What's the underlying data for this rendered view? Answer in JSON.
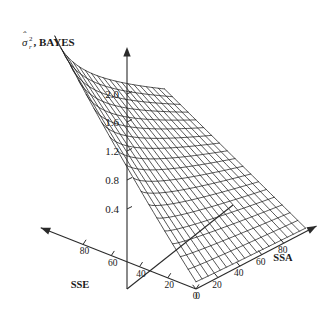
{
  "figure": {
    "type": "3d-surface-mesh",
    "background_color": "#ffffff",
    "line_color": "#1c1c1c",
    "axis_color": "#2a2a2a"
  },
  "zaxis": {
    "label_symbol": "σ",
    "label_hat": "ˆ",
    "label_superscript": "2",
    "label_subscript": "r",
    "label_text": ", BAYES",
    "full_label": "σ̂²r, BAYES",
    "ticks": [
      "2.0",
      "1.6",
      "1.2",
      "0.8",
      "0.4"
    ],
    "tick_values": [
      2.0,
      1.6,
      1.2,
      0.8,
      0.4
    ],
    "range": [
      0.0,
      2.4
    ],
    "arrow": "up"
  },
  "xaxis": {
    "label": "SSE",
    "ticks": [
      "80",
      "60",
      "40",
      "20",
      "0"
    ],
    "tick_values": [
      80,
      60,
      40,
      20,
      0
    ],
    "range": [
      0,
      100
    ],
    "direction": "decreasing-right",
    "arrow": "left"
  },
  "yaxis": {
    "label": "SSA",
    "ticks": [
      "0",
      "20",
      "40",
      "60",
      "80"
    ],
    "tick_values": [
      0,
      20,
      40,
      60,
      80
    ],
    "range": [
      0,
      100
    ],
    "direction": "increasing-right",
    "arrow": "right"
  },
  "chart_data": {
    "type": "surface",
    "title": "",
    "xlabel": "SSE",
    "ylabel": "SSA",
    "zlabel": "σ̂²r, BAYES",
    "xlim": [
      0,
      100
    ],
    "ylim": [
      0,
      100
    ],
    "zlim": [
      0,
      2.4
    ],
    "grid": false,
    "legend": "none",
    "mesh_rows": 19,
    "mesh_cols": 19,
    "x_ticklabels": [
      "80",
      "60",
      "40",
      "20",
      "0"
    ],
    "y_ticklabels": [
      "0",
      "20",
      "40",
      "60",
      "80"
    ],
    "z_ticklabels": [
      "2.0",
      "1.6",
      "1.2",
      "0.8",
      "0.4"
    ],
    "z_corner_values": {
      "sse0_ssa0": 0.1,
      "sse100_ssa0": 2.42,
      "sse0_ssa100": 0.05,
      "sse100_ssa100": 1.2
    },
    "z_at_origin_axis": 1.2,
    "surface_samples": [
      {
        "sse": 0,
        "ssa": 0,
        "z": 0.1
      },
      {
        "sse": 25,
        "ssa": 0,
        "z": 0.62
      },
      {
        "sse": 50,
        "ssa": 0,
        "z": 1.22
      },
      {
        "sse": 75,
        "ssa": 0,
        "z": 1.85
      },
      {
        "sse": 100,
        "ssa": 0,
        "z": 2.42
      },
      {
        "sse": 0,
        "ssa": 25,
        "z": 0.09
      },
      {
        "sse": 50,
        "ssa": 25,
        "z": 1.06
      },
      {
        "sse": 100,
        "ssa": 25,
        "z": 2.05
      },
      {
        "sse": 0,
        "ssa": 50,
        "z": 0.08
      },
      {
        "sse": 50,
        "ssa": 50,
        "z": 0.9
      },
      {
        "sse": 100,
        "ssa": 50,
        "z": 1.7
      },
      {
        "sse": 0,
        "ssa": 75,
        "z": 0.06
      },
      {
        "sse": 50,
        "ssa": 75,
        "z": 0.75
      },
      {
        "sse": 100,
        "ssa": 75,
        "z": 1.42
      },
      {
        "sse": 0,
        "ssa": 100,
        "z": 0.05
      },
      {
        "sse": 50,
        "ssa": 100,
        "z": 0.62
      },
      {
        "sse": 100,
        "ssa": 100,
        "z": 1.2
      }
    ]
  }
}
